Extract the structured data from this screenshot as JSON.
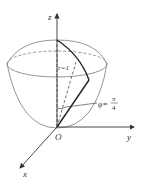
{
  "diagram": {
    "axes": {
      "z_label": "z",
      "y_label": "y",
      "x_label": "x",
      "origin_label": "O"
    },
    "annotations": {
      "radius_label": "r=1",
      "angle_label_prefix": "φ=",
      "angle_numerator": "π",
      "angle_denominator": "4"
    },
    "colors": {
      "ink": "#333333",
      "surface": "#8a8a8a"
    }
  }
}
